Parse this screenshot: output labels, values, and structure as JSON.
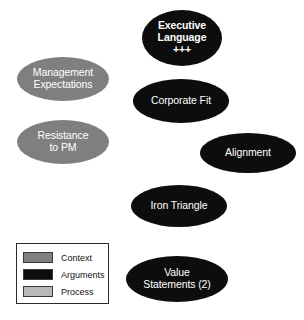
{
  "diagram": {
    "nodes": [
      {
        "id": "executive-language",
        "label": "Executive\nLanguage\n+++",
        "category": "Arguments",
        "emphasis": "+++",
        "color": "#0d0d0d",
        "text_color": "#ffffff"
      },
      {
        "id": "management-expectations",
        "label": "Management\nExpectations",
        "category": "Context",
        "color": "#7f7f7f",
        "text_color": "#ffffff"
      },
      {
        "id": "corporate-fit",
        "label": "Corporate Fit",
        "category": "Arguments",
        "color": "#0d0d0d",
        "text_color": "#ffffff"
      },
      {
        "id": "resistance-to-pm",
        "label": "Resistance\nto PM",
        "category": "Context",
        "color": "#7f7f7f",
        "text_color": "#ffffff"
      },
      {
        "id": "alignment",
        "label": "Alignment",
        "category": "Arguments",
        "color": "#0d0d0d",
        "text_color": "#ffffff"
      },
      {
        "id": "iron-triangle",
        "label": "Iron Triangle",
        "category": "Arguments",
        "color": "#0d0d0d",
        "text_color": "#ffffff"
      },
      {
        "id": "value-statements",
        "label": "Value\nStatements (2)",
        "category": "Arguments",
        "count": 2,
        "color": "#0d0d0d",
        "text_color": "#ffffff"
      }
    ]
  },
  "legend": {
    "items": [
      {
        "label": "Context",
        "color": "#7f7f7f"
      },
      {
        "label": "Arguments",
        "color": "#0d0d0d"
      },
      {
        "label": "Process",
        "color": "#b8b8b8"
      }
    ]
  }
}
